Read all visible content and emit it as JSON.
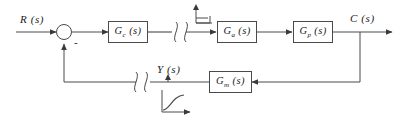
{
  "diagram": {
    "type": "control-block-diagram",
    "canvas": {
      "width": 404,
      "height": 120
    },
    "colors": {
      "line": "#4a4a4a",
      "text": "#1a1a1a",
      "background": "#ffffff"
    }
  },
  "signals": {
    "input": "R (s)",
    "output": "C (s)",
    "feedback": "Y (s)",
    "summing_sign": "-"
  },
  "blocks": [
    {
      "id": "controller",
      "base": "G",
      "subscript": "c",
      "arg": "(s)",
      "label": "G_c (s)"
    },
    {
      "id": "actuator",
      "base": "G",
      "subscript": "a",
      "arg": "(s)",
      "label": "G_a (s)"
    },
    {
      "id": "process",
      "base": "G",
      "subscript": "p",
      "arg": "(s)",
      "label": "G_p (s)"
    },
    {
      "id": "measurement",
      "base": "G",
      "subscript": "m",
      "arg": "(s)",
      "label": "G_m (s)"
    }
  ],
  "annotations": {
    "step_icon": "step-function-icon",
    "response_icon": "s-curve-response-icon",
    "break_forward": "line-break-symbol",
    "break_feedback": "line-break-symbol"
  }
}
